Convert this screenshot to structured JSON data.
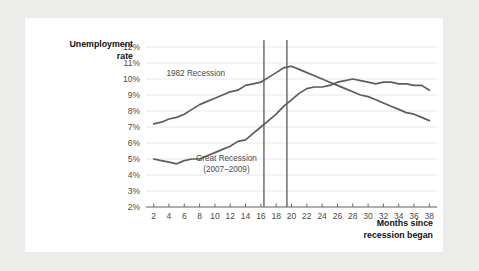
{
  "chart_data": {
    "type": "line",
    "title": "",
    "xlabel": "Months since recession began",
    "ylabel": "Unemployment rate",
    "xlim": [
      1,
      39
    ],
    "ylim": [
      2,
      12
    ],
    "grid": true,
    "legend": "inline-annotations",
    "xticks": [
      2,
      4,
      6,
      8,
      10,
      12,
      14,
      16,
      18,
      20,
      22,
      24,
      26,
      28,
      30,
      32,
      34,
      36,
      38
    ],
    "xtick_labels": [
      "2",
      "4",
      "6",
      "8",
      "10",
      "12",
      "14",
      "16",
      "18",
      "20",
      "22",
      "24",
      "26",
      "28",
      "30",
      "32",
      "34",
      "36",
      "38"
    ],
    "yticks": [
      2,
      3,
      4,
      5,
      6,
      7,
      8,
      9,
      10,
      11,
      12
    ],
    "ytick_labels": [
      "2%",
      "3%",
      "4%",
      "5%",
      "6%",
      "7%",
      "8%",
      "9%",
      "10%",
      "11%",
      "12%"
    ],
    "annotations": [
      {
        "text": "1982 Recession",
        "x": 7.5,
        "y": 10.2
      },
      {
        "text": "Great Recession",
        "x": 11.5,
        "y": 4.85
      },
      {
        "text": "(2007–2009)",
        "x": 11.5,
        "y": 4.2
      }
    ],
    "markers": [
      {
        "label": "",
        "x": 16.4
      },
      {
        "label": "",
        "x": 19.4
      }
    ],
    "series": [
      {
        "name": "1982 Recession",
        "x": [
          2,
          3,
          4,
          5,
          6,
          7,
          8,
          9,
          10,
          11,
          12,
          13,
          14,
          15,
          16,
          17,
          18,
          19,
          20,
          21,
          22,
          23,
          24,
          25,
          26,
          27,
          28,
          29,
          30,
          31,
          32,
          33,
          34,
          35,
          36,
          37,
          38
        ],
        "values": [
          7.2,
          7.3,
          7.5,
          7.6,
          7.8,
          8.1,
          8.4,
          8.6,
          8.8,
          9.0,
          9.2,
          9.3,
          9.6,
          9.7,
          9.8,
          10.1,
          10.4,
          10.7,
          10.8,
          10.6,
          10.4,
          10.2,
          10.0,
          9.8,
          9.6,
          9.4,
          9.2,
          9.0,
          8.9,
          8.7,
          8.5,
          8.3,
          8.1,
          7.9,
          7.8,
          7.6,
          7.4
        ]
      },
      {
        "name": "Great Recession (2007–2009)",
        "x": [
          2,
          3,
          4,
          5,
          6,
          7,
          8,
          9,
          10,
          11,
          12,
          13,
          14,
          15,
          16,
          17,
          18,
          19,
          20,
          21,
          22,
          23,
          24,
          25,
          26,
          27,
          28,
          29,
          30,
          31,
          32,
          33,
          34,
          35,
          36,
          37,
          38
        ],
        "values": [
          5.0,
          4.9,
          4.8,
          4.7,
          4.9,
          5.0,
          5.0,
          5.2,
          5.4,
          5.6,
          5.8,
          6.1,
          6.2,
          6.6,
          7.0,
          7.4,
          7.8,
          8.3,
          8.7,
          9.1,
          9.4,
          9.5,
          9.5,
          9.6,
          9.8,
          9.9,
          10.0,
          9.9,
          9.8,
          9.7,
          9.8,
          9.8,
          9.7,
          9.7,
          9.6,
          9.6,
          9.3
        ]
      }
    ]
  },
  "axis_titles": {
    "y_line1": "Unemployment",
    "y_line2": "rate",
    "x_line1": "Months since",
    "x_line2": "recession began"
  },
  "colors": {
    "background": "#ececeb",
    "card": "#ffffff",
    "series_line": "#5d5d5d",
    "grid": "#dfe3ea",
    "axis": "#6b6b6b",
    "marker": "#6e6e6e",
    "text": "#4a4a4a"
  }
}
